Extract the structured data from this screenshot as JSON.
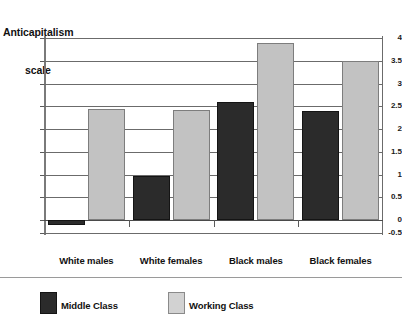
{
  "chart_data": {
    "type": "bar",
    "title": "Anticapitalism scale",
    "title_line1": "Anticapitalism",
    "title_line2": "scale",
    "xlabel": "",
    "ylabel": "Anticapitalism scale",
    "ylim": [
      -0.5,
      4
    ],
    "yticks": [
      4,
      3.5,
      3,
      2.5,
      2,
      1.5,
      1,
      0.5,
      0,
      -0.5
    ],
    "ytick_labels": [
      "4",
      "3.5",
      "3",
      "2.5",
      "2",
      "1.5",
      "1",
      "0.5",
      "0",
      "-0.5"
    ],
    "grid": true,
    "legend_position": "bottom-left",
    "categories": [
      "White males",
      "White females",
      "Black males",
      "Black females"
    ],
    "series": [
      {
        "name": "Middle Class",
        "color": "#2b2b2b",
        "values": [
          -0.2,
          0.97,
          2.6,
          2.4
        ]
      },
      {
        "name": "Working Class",
        "color": "#c2c2c2",
        "values": [
          2.43,
          2.42,
          3.88,
          3.5
        ]
      }
    ]
  },
  "legend": {
    "items": [
      {
        "label": "Middle Class"
      },
      {
        "label": "Working Class"
      }
    ]
  }
}
